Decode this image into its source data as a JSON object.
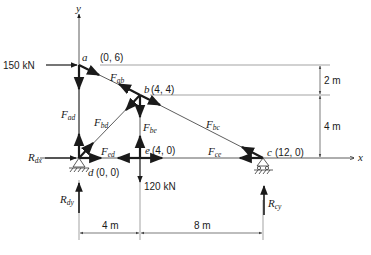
{
  "axes": {
    "x_label": "x",
    "y_label": "y"
  },
  "nodes": {
    "a": {
      "name": "a",
      "coord": "(0, 6)"
    },
    "b": {
      "name": "b",
      "coord": "(4, 4)"
    },
    "c": {
      "name": "c",
      "coord": "(12, 0)"
    },
    "d": {
      "name": "d",
      "coord": "(0, 0)"
    },
    "e": {
      "name": "e",
      "coord": "(4, 0)"
    }
  },
  "members": {
    "ab": {
      "main": "F",
      "sub": "ab"
    },
    "ad": {
      "main": "F",
      "sub": "ad"
    },
    "bd": {
      "main": "F",
      "sub": "bd"
    },
    "be": {
      "main": "F",
      "sub": "be"
    },
    "bc": {
      "main": "F",
      "sub": "bc"
    },
    "ed": {
      "main": "F",
      "sub": "ed"
    },
    "ce": {
      "main": "F",
      "sub": "ce"
    }
  },
  "loads": {
    "horizontal_a": "150 kN",
    "vertical_e": "120 kN"
  },
  "reactions": {
    "Rdx": {
      "main": "R",
      "sub": "dx"
    },
    "Rdy": {
      "main": "R",
      "sub": "dy"
    },
    "Rcy": {
      "main": "R",
      "sub": "cy"
    }
  },
  "dimensions": {
    "vertical_top": "2 m",
    "vertical_bottom": "4 m",
    "horizontal_left": "4 m",
    "horizontal_right": "8 m"
  },
  "colors": {
    "ink": "#1a1a1a",
    "thin": "#555555",
    "background": "#ffffff"
  }
}
